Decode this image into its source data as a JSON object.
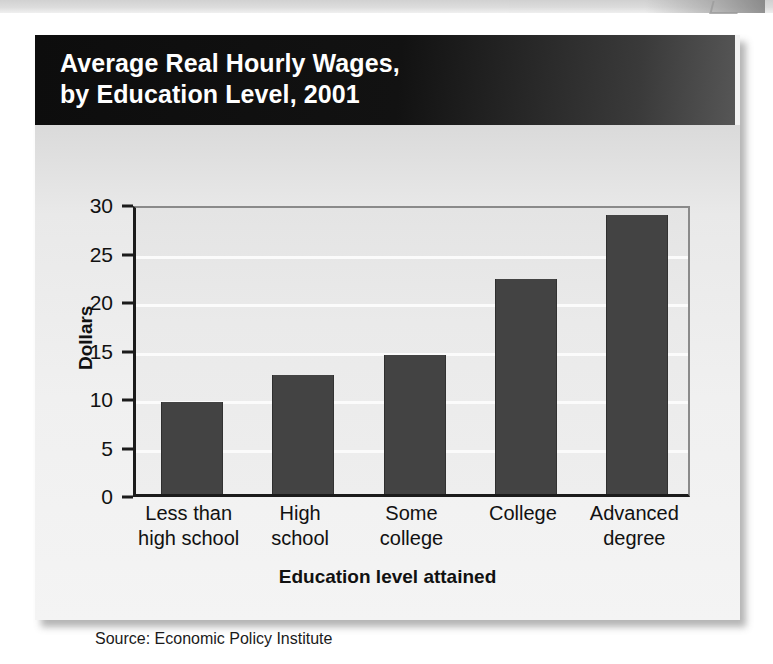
{
  "figure": {
    "title_line1": "Average Real Hourly Wages,",
    "title_line2": "by Education Level, 2001",
    "source": "Source: Economic Policy Institute"
  },
  "chart_data": {
    "type": "bar",
    "title": "Average Real Hourly Wages, by Education Level, 2001",
    "subtitle": "",
    "xlabel": "Education level attained",
    "ylabel": "Dollars",
    "categories": [
      "Less than high school",
      "High school",
      "Some college",
      "College",
      "Advanced degree"
    ],
    "category_lines": [
      {
        "line1": "Less than",
        "line2": "high school"
      },
      {
        "line1": "High",
        "line2": "school"
      },
      {
        "line1": "Some",
        "line2": "college"
      },
      {
        "line1": "College",
        "line2": ""
      },
      {
        "line1": "Advanced",
        "line2": "degree"
      }
    ],
    "values": [
      9.5,
      12.3,
      14.3,
      22.2,
      28.8
    ],
    "ylim": [
      0,
      30
    ],
    "ytick_labels": [
      "0",
      "5",
      "10",
      "15",
      "20",
      "25",
      "30"
    ],
    "ytick_values": [
      0,
      5,
      10,
      15,
      20,
      25,
      30
    ],
    "grid": "horizontal",
    "legend": "none",
    "bar_color": "#434343",
    "plot_background": "#eaeaea",
    "banner_color": "#111111",
    "annotations": []
  }
}
